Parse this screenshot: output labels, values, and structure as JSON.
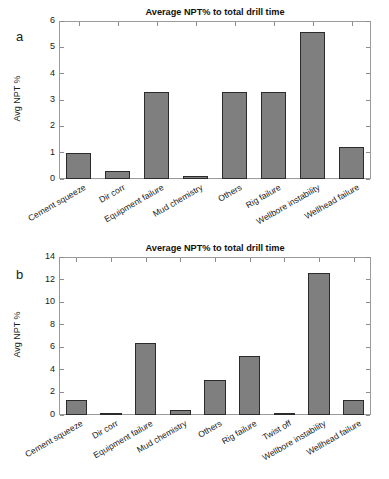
{
  "figure": {
    "panels": [
      {
        "letter": "a",
        "title": "Average NPT% to total drill time",
        "ylabel": "Avg NPT %",
        "yticks": [
          "0",
          "1",
          "2",
          "3",
          "4",
          "5",
          "6"
        ],
        "categories": [
          "Cement squeeze",
          "Dir corr",
          "Equipment failure",
          "Mud chemistry",
          "Others",
          "Rig failure",
          "Wellbore instability",
          "Wellhead failure"
        ]
      },
      {
        "letter": "b",
        "title": "Average NPT% to total drill time",
        "ylabel": "Avg NPT %",
        "yticks": [
          "0",
          "2",
          "4",
          "6",
          "8",
          "10",
          "12",
          "14"
        ],
        "categories": [
          "Cement squeeze",
          "Dir corr",
          "Equipment failure",
          "Mud chemistry",
          "Others",
          "Rig failure",
          "Twist off",
          "Wellbore instability",
          "Wellhead failure"
        ]
      }
    ]
  },
  "chart_data": [
    {
      "type": "bar",
      "panel": "a",
      "title": "Average NPT% to total drill time",
      "xlabel": "",
      "ylabel": "Avg NPT %",
      "ylim": [
        0,
        6
      ],
      "ytick_step": 1,
      "yticks": [
        0,
        1,
        2,
        3,
        4,
        5,
        6
      ],
      "grid": false,
      "legend": "none",
      "bar_color": "#7f7f7f",
      "bar_edge_color": "#2b2b2b",
      "categories": [
        "Cement squeeze",
        "Dir corr",
        "Equipment failure",
        "Mud chemistry",
        "Others",
        "Rig failure",
        "Wellbore instability",
        "Wellhead failure"
      ],
      "values": [
        1.0,
        0.3,
        3.3,
        0.1,
        3.3,
        3.3,
        5.6,
        1.2
      ]
    },
    {
      "type": "bar",
      "panel": "b",
      "title": "Average NPT% to total drill time",
      "xlabel": "",
      "ylabel": "Avg NPT %",
      "ylim": [
        0,
        14
      ],
      "ytick_step": 2,
      "yticks": [
        0,
        2,
        4,
        6,
        8,
        10,
        12,
        14
      ],
      "grid": false,
      "legend": "none",
      "bar_color": "#7f7f7f",
      "bar_edge_color": "#2b2b2b",
      "categories": [
        "Cement squeeze",
        "Dir corr",
        "Equipment failure",
        "Mud chemistry",
        "Others",
        "Rig failure",
        "Twist off",
        "Wellbore instability",
        "Wellhead failure"
      ],
      "values": [
        1.3,
        0.2,
        6.4,
        0.4,
        3.1,
        5.2,
        0.2,
        12.6,
        1.3
      ]
    }
  ]
}
